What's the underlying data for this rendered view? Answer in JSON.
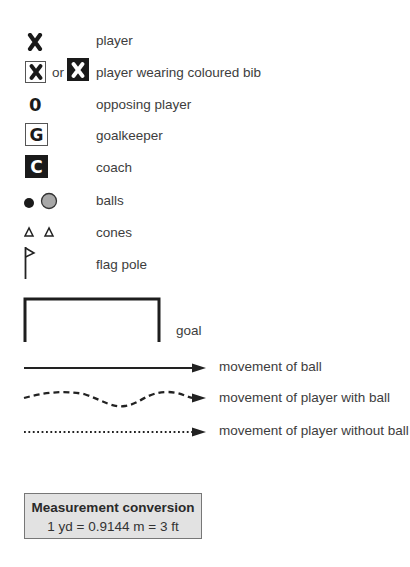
{
  "legend": {
    "items": [
      {
        "icon": "cross-x-icon",
        "label": "player"
      },
      {
        "icon": "boxed-x-icon",
        "connector": "or",
        "label": "player wearing coloured bib"
      },
      {
        "icon": "zero-icon",
        "glyph": "0",
        "label": "opposing player"
      },
      {
        "icon": "boxed-g-icon",
        "glyph": "G",
        "label": "goalkeeper"
      },
      {
        "icon": "filled-c-icon",
        "glyph": "C",
        "label": "coach"
      },
      {
        "icon": "balls-icon",
        "label": "balls"
      },
      {
        "icon": "cones-icon",
        "label": "cones"
      },
      {
        "icon": "flag-pole-icon",
        "label": "flag pole"
      },
      {
        "icon": "goal-icon",
        "label": "goal"
      }
    ],
    "movements": [
      {
        "icon": "solid-arrow-icon",
        "label": "movement of ball"
      },
      {
        "icon": "dashed-wavy-arrow-icon",
        "label": "movement of player with ball"
      },
      {
        "icon": "dotted-arrow-icon",
        "label": "movement of player without ball"
      }
    ]
  },
  "glyphs": {
    "x": "✖"
  },
  "measurement": {
    "title": "Measurement conversion",
    "value": "1 yd = 0.9144 m = 3 ft"
  },
  "colors": {
    "ink": "#1a1a1a",
    "ball_grey": "#a8a8a8",
    "box_bg": "#e2e2e2"
  }
}
